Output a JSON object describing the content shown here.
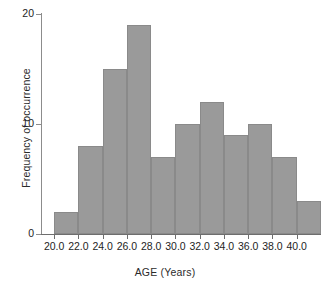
{
  "chart_data": {
    "type": "bar",
    "title": "",
    "xlabel": "AGE (Years)",
    "ylabel": "Frequency of occurrence",
    "categories": [
      "20.0",
      "22.0",
      "24.0",
      "26.0",
      "28.0",
      "30.0",
      "32.0",
      "34.0",
      "36.0",
      "38.0",
      "40.0"
    ],
    "bin_starts": [
      20.0,
      22.0,
      24.0,
      26.0,
      28.0,
      30.0,
      32.0,
      34.0,
      36.0,
      38.0,
      40.0
    ],
    "bin_width": 2.0,
    "values": [
      2,
      8,
      15,
      19,
      7,
      10,
      12,
      9,
      10,
      7,
      3
    ],
    "bars": [
      {
        "label": "20.0",
        "bin_start": 20.0,
        "bin_end": 22.0,
        "value": 2
      },
      {
        "label": "22.0",
        "bin_start": 22.0,
        "bin_end": 24.0,
        "value": 8
      },
      {
        "label": "24.0",
        "bin_start": 24.0,
        "bin_end": 26.0,
        "value": 15
      },
      {
        "label": "26.0",
        "bin_start": 26.0,
        "bin_end": 28.0,
        "value": 19
      },
      {
        "label": "28.0",
        "bin_start": 28.0,
        "bin_end": 30.0,
        "value": 7
      },
      {
        "label": "30.0",
        "bin_start": 30.0,
        "bin_end": 32.0,
        "value": 10
      },
      {
        "label": "32.0",
        "bin_start": 32.0,
        "bin_end": 34.0,
        "value": 12
      },
      {
        "label": "34.0",
        "bin_start": 34.0,
        "bin_end": 36.0,
        "value": 9
      },
      {
        "label": "36.0",
        "bin_start": 36.0,
        "bin_end": 38.0,
        "value": 10
      },
      {
        "label": "38.0",
        "bin_start": 38.0,
        "bin_end": 40.0,
        "value": 7
      },
      {
        "label": "40.0",
        "bin_start": 40.0,
        "bin_end": 42.0,
        "value": 3
      }
    ],
    "xlim": [
      19.0,
      42.0
    ],
    "ylim": [
      0,
      20
    ],
    "yticks": [
      0,
      10,
      20
    ],
    "ytick_labels": [
      "0",
      "10",
      "20"
    ],
    "xticks": [
      20.0,
      22.0,
      24.0,
      26.0,
      28.0,
      30.0,
      32.0,
      34.0,
      36.0,
      38.0,
      40.0
    ],
    "xtick_labels": [
      "20.0",
      "22.0",
      "24.0",
      "26.0",
      "28.0",
      "30.0",
      "32.0",
      "34.0",
      "36.0",
      "38.0",
      "40.0"
    ],
    "grid": false,
    "legend": false,
    "bar_color": "#9a9a9a",
    "bar_edge_color": "#8a8a8a",
    "axis_color": "#6e6e6e",
    "text_color": "#1e1e1e",
    "background": "#ffffff"
  }
}
